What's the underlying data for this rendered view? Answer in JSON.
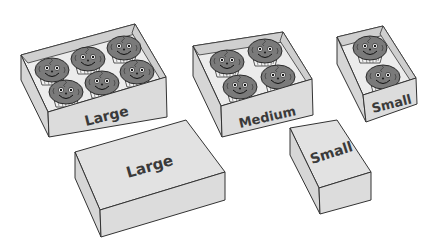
{
  "colors": {
    "box_fill": "#dcdcdc",
    "box_outline": "#333333",
    "muffin": "#7a7a7a",
    "label_text": "#3a3a3a",
    "background": "#ffffff"
  },
  "open_boxes": [
    {
      "label": "Large",
      "muffin_count": 6
    },
    {
      "label": "Medium",
      "muffin_count": 4
    },
    {
      "label": "Small",
      "muffin_count": 2
    }
  ],
  "closed_boxes": [
    {
      "label": "Large"
    },
    {
      "label": "Small"
    }
  ]
}
